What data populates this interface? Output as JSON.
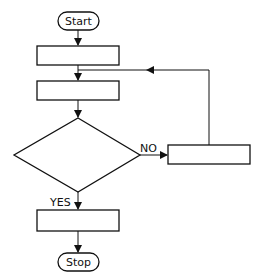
{
  "diagram": {
    "type": "flowchart",
    "nodes": [
      {
        "id": "start",
        "shape": "terminator",
        "label": "Start"
      },
      {
        "id": "process1",
        "shape": "process",
        "label": ""
      },
      {
        "id": "process2",
        "shape": "process",
        "label": ""
      },
      {
        "id": "decision",
        "shape": "decision",
        "label": ""
      },
      {
        "id": "process_no",
        "shape": "process",
        "label": ""
      },
      {
        "id": "process_yes",
        "shape": "process",
        "label": ""
      },
      {
        "id": "stop",
        "shape": "terminator",
        "label": "Stop"
      }
    ],
    "edges": [
      {
        "from": "start",
        "to": "process1",
        "label": ""
      },
      {
        "from": "process1",
        "to": "process2",
        "label": ""
      },
      {
        "from": "process2",
        "to": "decision",
        "label": ""
      },
      {
        "from": "decision",
        "to": "process_no",
        "label": "NO"
      },
      {
        "from": "process_no",
        "to": "process2",
        "label": ""
      },
      {
        "from": "decision",
        "to": "process_yes",
        "label": "YES"
      },
      {
        "from": "process_yes",
        "to": "stop",
        "label": ""
      }
    ]
  },
  "labels": {
    "start": "Start",
    "stop": "Stop",
    "no": "NO",
    "yes": "YES"
  },
  "colors": {
    "stroke": "#111111",
    "background": "#ffffff"
  }
}
